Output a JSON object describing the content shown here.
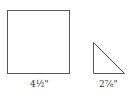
{
  "diagram": {
    "shapes": [
      {
        "type": "square",
        "label": "4½\"",
        "dimension": "4 1/2 inches",
        "stroke_color": "#555555",
        "fill_color": "#ffffff"
      },
      {
        "type": "right-triangle",
        "label": "2⅞\"",
        "dimension": "2 7/8 inches",
        "stroke_color": "#555555",
        "fill_color": "#ffffff"
      }
    ]
  }
}
